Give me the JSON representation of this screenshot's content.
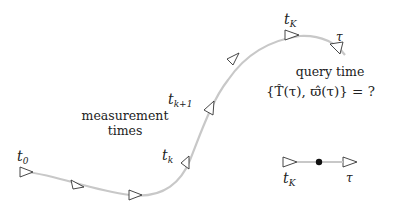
{
  "labels": {
    "t0": {
      "base": "t",
      "sub": "0"
    },
    "tk": {
      "base": "t",
      "sub": "k"
    },
    "tk1": {
      "base": "t",
      "sub": "k+1"
    },
    "tK": {
      "base": "t",
      "sub": "K"
    },
    "tau": "τ",
    "tK_bottom": {
      "base": "t",
      "sub": "K"
    },
    "tau_bottom": "τ"
  },
  "annotations": {
    "measurement_line1": "measurement",
    "measurement_line2": "times",
    "query_line1": "query time",
    "query_formula": "{T̂(τ), ϖ̂(τ)} = ?"
  },
  "colors": {
    "curve": "#c8c8c8",
    "marker_stroke": "#333333",
    "dot": "#111111"
  }
}
